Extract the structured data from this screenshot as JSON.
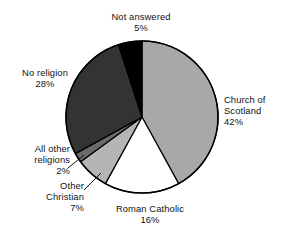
{
  "chart_data": {
    "type": "pie",
    "title": "",
    "subtitle": "",
    "xlabel": "",
    "ylabel": "",
    "legend_position": "none",
    "grid": false,
    "units": "percent",
    "categories": [
      "Church of Scotland",
      "Roman Catholic",
      "Other Christian",
      "All other religions",
      "No religion",
      "Not answered"
    ],
    "values": [
      42,
      16,
      7,
      2,
      28,
      5
    ],
    "slices": [
      {
        "label": "Church of Scotland",
        "label_line1": "Church of",
        "label_line2": "Scotland",
        "value": 42,
        "value_text": "42%",
        "color": "#a8a8a8",
        "start_angle": 0,
        "end_angle": 151.2,
        "leader_line": false
      },
      {
        "label": "Roman Catholic",
        "label_line1": "Roman Catholic",
        "label_line2": "",
        "value": 16,
        "value_text": "16%",
        "color": "#ffffff",
        "start_angle": 151.2,
        "end_angle": 208.8,
        "leader_line": false
      },
      {
        "label": "Other Christian",
        "label_line1": "Other",
        "label_line2": "Christian",
        "value": 7,
        "value_text": "7%",
        "color": "#b5b5b5",
        "start_angle": 208.8,
        "end_angle": 234.0,
        "leader_line": true
      },
      {
        "label": "All other religions",
        "label_line1": "All other",
        "label_line2": "religions",
        "value": 2,
        "value_text": "2%",
        "color": "#6b6b6b",
        "start_angle": 234.0,
        "end_angle": 241.2,
        "leader_line": true
      },
      {
        "label": "No religion",
        "label_line1": "No religion",
        "label_line2": "",
        "value": 28,
        "value_text": "28%",
        "color": "#333333",
        "start_angle": 241.2,
        "end_angle": 342.0,
        "leader_line": false
      },
      {
        "label": "Not answered",
        "label_line1": "Not answered",
        "label_line2": "",
        "value": 5,
        "value_text": "5%",
        "color": "#000000",
        "start_angle": 342.0,
        "end_angle": 360.0,
        "leader_line": false
      }
    ],
    "outline_color": "#000000"
  }
}
